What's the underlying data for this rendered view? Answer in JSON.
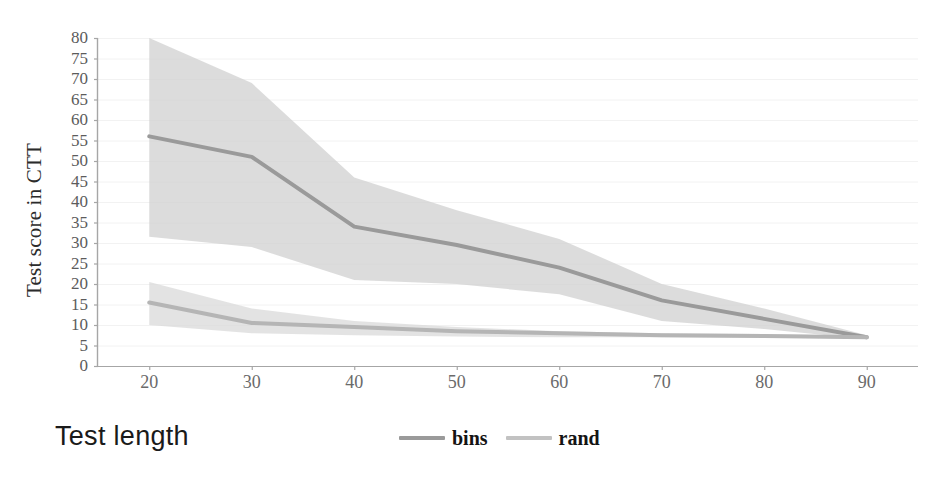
{
  "chart_data": {
    "type": "line",
    "title": "",
    "xlabel": "Test length",
    "ylabel": "Test score in CTT",
    "xlim": [
      15,
      95
    ],
    "ylim": [
      0,
      80
    ],
    "xticks": [
      20,
      30,
      40,
      50,
      60,
      70,
      80,
      90
    ],
    "yticks": [
      0,
      5,
      10,
      15,
      20,
      25,
      30,
      35,
      40,
      45,
      50,
      55,
      60,
      65,
      70,
      75,
      80
    ],
    "grid": true,
    "grid_axis": "y",
    "legend_position": "bottom-center",
    "x": [
      20,
      30,
      40,
      50,
      60,
      70,
      80,
      90
    ],
    "series": [
      {
        "name": "bins",
        "color": "#9a9a9a",
        "values": [
          56,
          51,
          34,
          29.5,
          24,
          16,
          11.5,
          7
        ],
        "band_upper": [
          80,
          69,
          46,
          38,
          31,
          20,
          14,
          7.5
        ],
        "band_lower": [
          31.5,
          29,
          21,
          20,
          17.5,
          11,
          9,
          6.5
        ],
        "band_color": "#cfcfcf"
      },
      {
        "name": "rand",
        "color": "#b5b5b5",
        "values": [
          15.5,
          10.5,
          9.5,
          8.5,
          8,
          7.5,
          7.3,
          7
        ],
        "band_upper": [
          20.5,
          14,
          11,
          9.5,
          8.5,
          8,
          7.8,
          7.3
        ],
        "band_lower": [
          10,
          8,
          7.5,
          7.2,
          7,
          7,
          6.9,
          6.7
        ],
        "band_color": "#d8d8d8"
      }
    ]
  },
  "axes": {
    "y_tick_labels": [
      "80",
      "75",
      "70",
      "65",
      "60",
      "55",
      "50",
      "45",
      "40",
      "35",
      "30",
      "25",
      "20",
      "15",
      "10",
      "5",
      "0"
    ],
    "x_tick_labels": [
      "20",
      "30",
      "40",
      "50",
      "60",
      "70",
      "80",
      "90"
    ],
    "y_axis_title": "Test score in CTT",
    "x_axis_title": "Test length"
  },
  "legend": {
    "items": [
      {
        "label": "bins",
        "color": "#9a9a9a"
      },
      {
        "label": "rand",
        "color": "#c2c2c2"
      }
    ]
  },
  "colors": {
    "background": "#ffffff",
    "axis_line": "#a6a6a6",
    "grid_line": "#f2f2f2",
    "bins_line": "#9a9a9a",
    "rand_line": "#b5b5b5",
    "band_fill": "#d0d0d0"
  }
}
